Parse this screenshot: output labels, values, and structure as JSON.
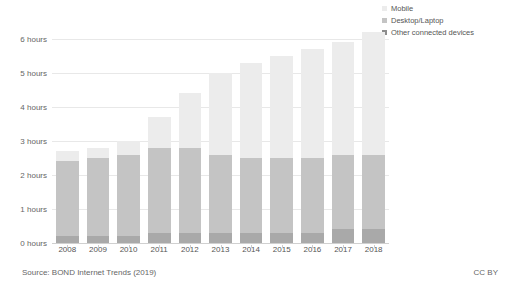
{
  "chart_data": {
    "type": "bar",
    "subtype": "stacked-bar",
    "title": "",
    "xlabel": "",
    "ylabel": "",
    "ylim": [
      0,
      6.5
    ],
    "ytick_values": [
      0,
      1,
      2,
      3,
      4,
      5,
      6
    ],
    "ytick_labels": [
      "0 hours",
      "1 hours",
      "2 hours",
      "3 hours",
      "4 hours",
      "5 hours",
      "6 hours"
    ],
    "grid": true,
    "legend_position": "top-right",
    "categories": [
      "2008",
      "2009",
      "2010",
      "2011",
      "2012",
      "2013",
      "2014",
      "2015",
      "2016",
      "2017",
      "2018"
    ],
    "series": [
      {
        "name": "Other connected devices",
        "color": "#a9a9a9",
        "values": [
          0.2,
          0.2,
          0.2,
          0.3,
          0.3,
          0.3,
          0.3,
          0.3,
          0.3,
          0.4,
          0.4
        ]
      },
      {
        "name": "Desktop/Laptop",
        "color": "#c4c4c4",
        "values": [
          2.2,
          2.3,
          2.4,
          2.5,
          2.5,
          2.3,
          2.2,
          2.2,
          2.2,
          2.2,
          2.2
        ]
      },
      {
        "name": "Mobile",
        "color": "#ececec",
        "values": [
          0.3,
          0.3,
          0.4,
          0.9,
          1.6,
          2.4,
          2.8,
          3.0,
          3.2,
          3.3,
          3.6
        ]
      }
    ],
    "totals": [
      2.7,
      2.8,
      3.0,
      3.7,
      4.4,
      5.0,
      5.3,
      5.5,
      5.7,
      5.9,
      6.2
    ]
  },
  "legend": {
    "items": [
      {
        "label": "Mobile",
        "color": "#ececec"
      },
      {
        "label": "Desktop/Laptop",
        "color": "#c4c4c4"
      },
      {
        "label": "Other connected devices",
        "color": "#8c8c8c"
      }
    ]
  },
  "footer": {
    "source": "Source: BOND Internet Trends (2019)",
    "license": "CC BY"
  },
  "colors": {
    "mobile": "#ececec",
    "desktop": "#c4c4c4",
    "other": "#a9a9a9",
    "grid": "#e8e8e8",
    "text": "#555555"
  }
}
